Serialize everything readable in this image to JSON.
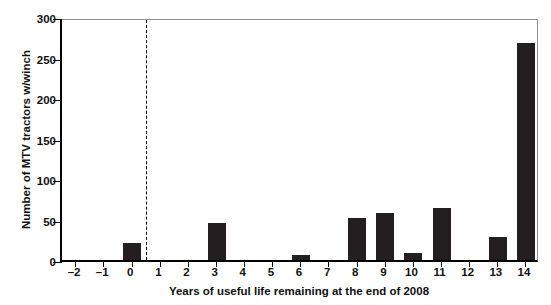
{
  "chart_data": {
    "type": "bar",
    "title": "",
    "xlabel": "Years of useful life remaining at the end of 2008",
    "ylabel": "Number of MTV tractors w/winch",
    "categories": [
      "-2",
      "-1",
      "0",
      "1",
      "2",
      "3",
      "4",
      "5",
      "6",
      "7",
      "8",
      "9",
      "10",
      "11",
      "12",
      "13",
      "14"
    ],
    "values": [
      0,
      0,
      21,
      0,
      0,
      46,
      0,
      0,
      6,
      0,
      52,
      58,
      9,
      64,
      0,
      28,
      268
    ],
    "xlim": [
      -2.5,
      14.5
    ],
    "ylim": [
      0,
      300
    ],
    "yticks": [
      0,
      50,
      100,
      150,
      200,
      250,
      300
    ],
    "ytick_labels": [
      "0",
      "50",
      "100",
      "150",
      "200",
      "250",
      "300"
    ],
    "xtick_labels": [
      "–2",
      "–1",
      "0",
      "1",
      "2",
      "3",
      "4",
      "5",
      "6",
      "7",
      "8",
      "9",
      "10",
      "11",
      "12",
      "13",
      "14"
    ],
    "grid": false,
    "legend": null,
    "bar_color": "#231f20",
    "annotations": [
      {
        "name": "vertical-dashed-divider",
        "x": 0.5,
        "style": "dashed",
        "color": "#000000"
      }
    ]
  }
}
